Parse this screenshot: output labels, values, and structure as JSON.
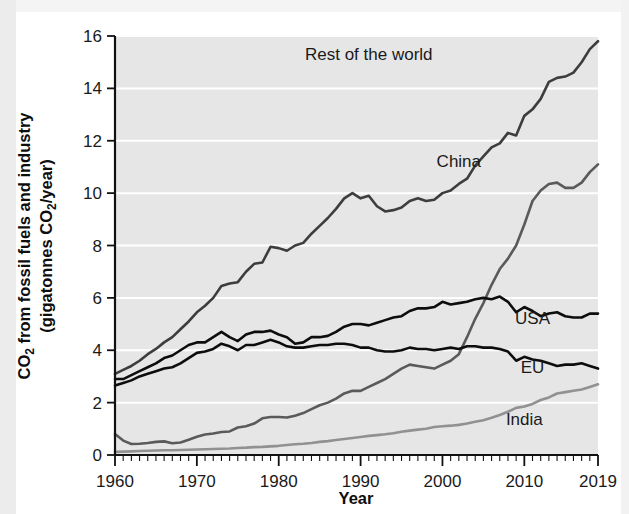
{
  "chart_data": {
    "type": "line",
    "title": "",
    "xlabel": "Year",
    "ylabel": "CO₂ from fossil fuels and industry (gigatonnes CO₂/year)",
    "ylabel_line1": "CO",
    "ylabel_line1_sub": "2",
    "ylabel_line1_rest": " from fossil fuels and industry",
    "ylabel_line2_a": "(gigatonnes CO",
    "ylabel_line2_sub": "2",
    "ylabel_line2_b": "/year)",
    "xlim": [
      1960,
      2019
    ],
    "ylim": [
      0,
      16
    ],
    "xticks": [
      1960,
      1970,
      1980,
      1990,
      2000,
      2010,
      2019
    ],
    "yticks": [
      0,
      2,
      4,
      6,
      8,
      10,
      12,
      14,
      16
    ],
    "xtick_labels": [
      "1960",
      "1970",
      "1980",
      "1990",
      "2000",
      "2010",
      "2019"
    ],
    "ytick_labels": [
      "0",
      "2",
      "4",
      "6",
      "8",
      "10",
      "12",
      "14",
      "16"
    ],
    "grid": "horizontal-white",
    "legend_position": "inline-annotations",
    "minor_ticks": "every 1 year",
    "x": [
      1960,
      1961,
      1962,
      1963,
      1964,
      1965,
      1966,
      1967,
      1968,
      1969,
      1970,
      1971,
      1972,
      1973,
      1974,
      1975,
      1976,
      1977,
      1978,
      1979,
      1980,
      1981,
      1982,
      1983,
      1984,
      1985,
      1986,
      1987,
      1988,
      1989,
      1990,
      1991,
      1992,
      1993,
      1994,
      1995,
      1996,
      1997,
      1998,
      1999,
      2000,
      2001,
      2002,
      2003,
      2004,
      2005,
      2006,
      2007,
      2008,
      2009,
      2010,
      2011,
      2012,
      2013,
      2014,
      2015,
      2016,
      2017,
      2018,
      2019
    ],
    "series": [
      {
        "name": "Rest of the world",
        "color": "#3d3d3d",
        "width": 2.6,
        "label_x": 1991,
        "label_y": 15.1,
        "values": [
          3.1,
          3.25,
          3.4,
          3.6,
          3.85,
          4.05,
          4.3,
          4.5,
          4.8,
          5.1,
          5.45,
          5.7,
          6.0,
          6.45,
          6.55,
          6.6,
          7.0,
          7.3,
          7.35,
          7.95,
          7.9,
          7.8,
          8.0,
          8.1,
          8.45,
          8.75,
          9.05,
          9.4,
          9.8,
          10.0,
          9.8,
          9.9,
          9.5,
          9.3,
          9.35,
          9.45,
          9.7,
          9.8,
          9.7,
          9.75,
          10.0,
          10.1,
          10.35,
          10.55,
          11.05,
          11.4,
          11.75,
          11.9,
          12.3,
          12.2,
          12.95,
          13.2,
          13.6,
          14.25,
          14.4,
          14.45,
          14.6,
          15.0,
          15.5,
          15.8
        ]
      },
      {
        "name": "China",
        "color": "#5a5a5a",
        "width": 2.6,
        "label_x": 2002,
        "label_y": 11.0,
        "values": [
          0.8,
          0.55,
          0.42,
          0.43,
          0.46,
          0.5,
          0.52,
          0.45,
          0.48,
          0.58,
          0.7,
          0.78,
          0.82,
          0.88,
          0.9,
          1.05,
          1.1,
          1.2,
          1.4,
          1.45,
          1.45,
          1.43,
          1.5,
          1.6,
          1.75,
          1.9,
          2.0,
          2.15,
          2.35,
          2.45,
          2.45,
          2.6,
          2.75,
          2.9,
          3.1,
          3.3,
          3.45,
          3.4,
          3.35,
          3.3,
          3.45,
          3.6,
          3.85,
          4.5,
          5.2,
          5.8,
          6.5,
          7.1,
          7.5,
          8.0,
          8.8,
          9.7,
          10.1,
          10.35,
          10.4,
          10.2,
          10.2,
          10.4,
          10.8,
          11.1
        ]
      },
      {
        "name": "USA",
        "color": "#0d0d0d",
        "width": 2.6,
        "label_x": 2011,
        "label_y": 5.0,
        "values": [
          2.9,
          2.9,
          3.05,
          3.2,
          3.35,
          3.5,
          3.7,
          3.8,
          4.0,
          4.2,
          4.3,
          4.3,
          4.5,
          4.7,
          4.5,
          4.35,
          4.6,
          4.7,
          4.7,
          4.75,
          4.6,
          4.5,
          4.25,
          4.3,
          4.5,
          4.5,
          4.55,
          4.7,
          4.9,
          5.0,
          5.0,
          4.95,
          5.05,
          5.15,
          5.25,
          5.3,
          5.5,
          5.6,
          5.6,
          5.65,
          5.85,
          5.75,
          5.8,
          5.85,
          5.95,
          6.0,
          5.95,
          6.05,
          5.85,
          5.45,
          5.65,
          5.5,
          5.3,
          5.4,
          5.45,
          5.3,
          5.25,
          5.25,
          5.4,
          5.4
        ]
      },
      {
        "name": "EU",
        "color": "#0d0d0d",
        "width": 2.6,
        "label_x": 2011,
        "label_y": 3.15,
        "values": [
          2.65,
          2.75,
          2.85,
          3.0,
          3.1,
          3.2,
          3.3,
          3.35,
          3.5,
          3.7,
          3.9,
          3.95,
          4.05,
          4.25,
          4.15,
          4.0,
          4.2,
          4.2,
          4.3,
          4.4,
          4.3,
          4.15,
          4.1,
          4.1,
          4.15,
          4.2,
          4.2,
          4.25,
          4.25,
          4.2,
          4.1,
          4.1,
          4.0,
          3.95,
          3.95,
          4.0,
          4.1,
          4.05,
          4.05,
          4.0,
          4.05,
          4.1,
          4.05,
          4.15,
          4.15,
          4.1,
          4.1,
          4.05,
          3.95,
          3.6,
          3.75,
          3.65,
          3.6,
          3.5,
          3.4,
          3.45,
          3.45,
          3.5,
          3.4,
          3.3
        ]
      },
      {
        "name": "India",
        "color": "#919191",
        "width": 2.6,
        "label_x": 2010,
        "label_y": 1.15,
        "values": [
          0.12,
          0.13,
          0.14,
          0.15,
          0.16,
          0.17,
          0.18,
          0.18,
          0.19,
          0.2,
          0.21,
          0.22,
          0.23,
          0.24,
          0.25,
          0.27,
          0.28,
          0.3,
          0.31,
          0.33,
          0.35,
          0.38,
          0.41,
          0.43,
          0.46,
          0.5,
          0.53,
          0.57,
          0.61,
          0.65,
          0.69,
          0.73,
          0.76,
          0.79,
          0.83,
          0.89,
          0.93,
          0.97,
          1.0,
          1.07,
          1.1,
          1.12,
          1.15,
          1.2,
          1.27,
          1.33,
          1.42,
          1.53,
          1.65,
          1.8,
          1.85,
          1.95,
          2.1,
          2.2,
          2.35,
          2.4,
          2.45,
          2.5,
          2.6,
          2.7
        ]
      }
    ]
  },
  "axis": {
    "x_label": "Year",
    "y_label_part1": "CO",
    "y_label_sub1": "2",
    "y_label_part2": " from fossil fuels and industry",
    "y_label_part3": "(gigatonnes CO",
    "y_label_sub2": "2",
    "y_label_part4": "/year)"
  }
}
